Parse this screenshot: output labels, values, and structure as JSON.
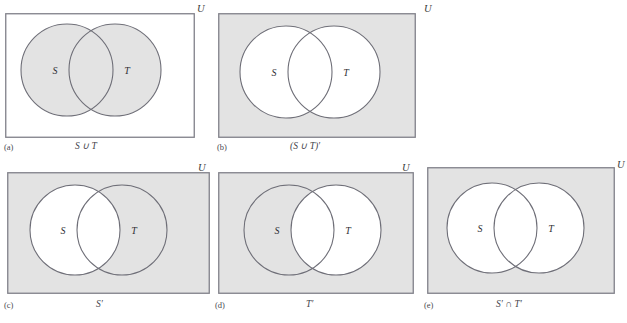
{
  "figure": {
    "universe_label": "U",
    "set_labels": {
      "s": "S",
      "t": "T"
    },
    "colors": {
      "shade": "#e3e3e3",
      "white": "#ffffff",
      "outline": "#6f6f78",
      "rect_border": "#808089",
      "text": "#44444a"
    },
    "panels": [
      {
        "letter": "(a)",
        "caption": "S ∪ T",
        "universe_label": "U",
        "rect_shaded": false,
        "circle_s_shaded": true,
        "circle_t_shaded": true,
        "overlap_shaded": true,
        "set_s": "S",
        "set_t": "T",
        "region_described": "union of S and T shaded"
      },
      {
        "letter": "(b)",
        "caption": "(S ∪ T)′",
        "universe_label": "U",
        "rect_shaded": true,
        "circle_s_shaded": false,
        "circle_t_shaded": false,
        "overlap_shaded": false,
        "set_s": "S",
        "set_t": "T",
        "region_described": "complement of union shaded"
      },
      {
        "letter": "(c)",
        "caption": "S′",
        "universe_label": "U",
        "rect_shaded": true,
        "circle_s_shaded": false,
        "circle_t_shaded": true,
        "overlap_shaded": false,
        "set_s": "S",
        "set_t": "T",
        "region_described": "everything outside S shaded"
      },
      {
        "letter": "(d)",
        "caption": "T′",
        "universe_label": "U",
        "rect_shaded": true,
        "circle_s_shaded": true,
        "circle_t_shaded": false,
        "overlap_shaded": false,
        "set_s": "S",
        "set_t": "T",
        "region_described": "everything outside T shaded"
      },
      {
        "letter": "(e)",
        "caption": "S′ ∩ T′",
        "universe_label": "U",
        "rect_shaded": true,
        "circle_s_shaded": false,
        "circle_t_shaded": false,
        "overlap_shaded": false,
        "set_s": "S",
        "set_t": "T",
        "region_described": "intersection of complements shaded"
      }
    ]
  }
}
